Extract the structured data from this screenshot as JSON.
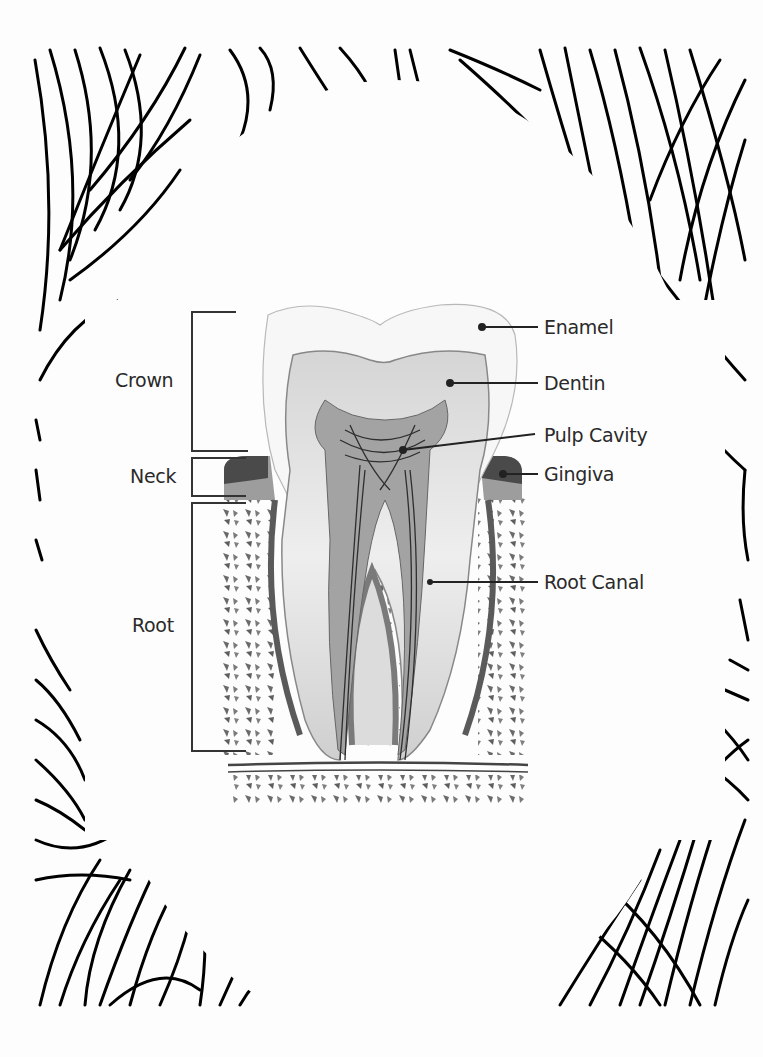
{
  "diagram": {
    "colors": {
      "frame_stroke": "#000000",
      "enamel": "#f3f3f3",
      "dentin": "#dedede",
      "pulp": "#9a9a9a",
      "gingiva_dark": "#4a4a4a",
      "gingiva_light": "#9d9d9d",
      "bone_speckle": "#6a6a6a",
      "label_text": "#2a2a2a",
      "leader_line": "#333333"
    },
    "region_labels": [
      {
        "id": "crown",
        "text": "Crown"
      },
      {
        "id": "neck",
        "text": "Neck"
      },
      {
        "id": "root",
        "text": "Root"
      }
    ],
    "part_labels": [
      {
        "id": "enamel",
        "text": "Enamel"
      },
      {
        "id": "dentin",
        "text": "Dentin"
      },
      {
        "id": "pulp-cavity",
        "text": "Pulp Cavity"
      },
      {
        "id": "gingiva",
        "text": "Gingiva"
      },
      {
        "id": "root-canal",
        "text": "Root Canal"
      }
    ]
  }
}
